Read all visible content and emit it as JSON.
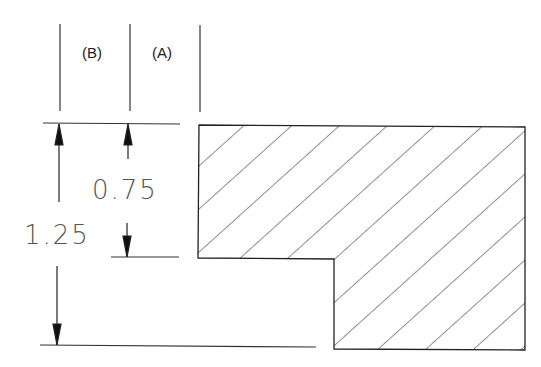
{
  "diagram": {
    "type": "engineering-section-drawing",
    "columns": [
      {
        "label": "(B)"
      },
      {
        "label": "(A)"
      }
    ],
    "dimensions": [
      {
        "label": "0.75",
        "description": "height of upper step"
      },
      {
        "label": "1.25",
        "description": "total height"
      }
    ],
    "hatch": "diagonal-45",
    "line_color": "#222222"
  }
}
